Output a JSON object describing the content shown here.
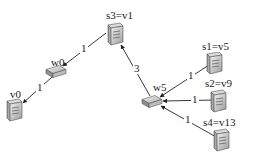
{
  "diagram": {
    "type": "network-topology",
    "nodes": [
      {
        "id": "s3",
        "label": "s3=v1",
        "kind": "server",
        "x": 113,
        "y": 34,
        "label_x": 106,
        "label_y": 10
      },
      {
        "id": "w0",
        "label": "w0",
        "kind": "router",
        "x": 57,
        "y": 72,
        "label_x": 51,
        "label_y": 57
      },
      {
        "id": "v0",
        "label": "v0",
        "kind": "server",
        "x": 14,
        "y": 110,
        "label_x": 10,
        "label_y": 89
      },
      {
        "id": "w5",
        "label": "w5",
        "kind": "router",
        "x": 152,
        "y": 102,
        "label_x": 153,
        "label_y": 82
      },
      {
        "id": "s1",
        "label": "s1=v5",
        "kind": "server",
        "x": 213,
        "y": 63,
        "label_x": 202,
        "label_y": 41
      },
      {
        "id": "s2",
        "label": "s2=v9",
        "kind": "server",
        "x": 217,
        "y": 100,
        "label_x": 205,
        "label_y": 78
      },
      {
        "id": "s4",
        "label": "s4=v13",
        "kind": "server",
        "x": 220,
        "y": 140,
        "label_x": 203,
        "label_y": 117
      }
    ],
    "edges": [
      {
        "from": "s3",
        "to": "w0",
        "weight": "1",
        "label_x": 80,
        "label_y": 43
      },
      {
        "from": "w0",
        "to": "v0",
        "weight": "1",
        "label_x": 37,
        "label_y": 81
      },
      {
        "from": "w5",
        "to": "s3",
        "weight": "3",
        "label_x": 135,
        "label_y": 63
      },
      {
        "from": "s1",
        "to": "w5",
        "weight": "1",
        "label_x": 188,
        "label_y": 70
      },
      {
        "from": "s2",
        "to": "w5",
        "weight": "1",
        "label_x": 192,
        "label_y": 93
      },
      {
        "from": "s4",
        "to": "w5",
        "weight": "1",
        "label_x": 186,
        "label_y": 115
      }
    ]
  },
  "colors": {
    "edge": "#222222",
    "device_light": "#e6e6e6",
    "device_mid": "#b5b5b5",
    "device_dark": "#7a7a7a",
    "text": "#222222"
  }
}
